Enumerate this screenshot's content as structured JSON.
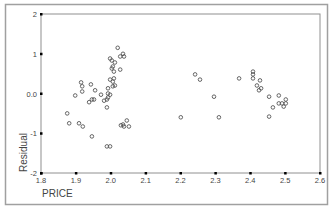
{
  "chart_data": {
    "type": "scatter",
    "title": "",
    "xlabel": "PRICE",
    "ylabel": "Residual",
    "xlim": [
      1.8,
      2.6
    ],
    "ylim": [
      -2,
      2
    ],
    "x_ticks": [
      "1.8",
      "1.9",
      "2.0",
      "2.1",
      "2.2",
      "2.3",
      "2.4",
      "2.5",
      "2.6"
    ],
    "y_ticks": [
      "2",
      "1",
      "0.0",
      "-1",
      "-2"
    ],
    "grid": false,
    "legend": null,
    "marker": "open-circle",
    "series": [
      {
        "name": "Residual vs PRICE",
        "points": [
          [
            2.02,
            1.15
          ],
          [
            2.035,
            1.0
          ],
          [
            2.027,
            0.93
          ],
          [
            2.038,
            0.93
          ],
          [
            1.998,
            0.88
          ],
          [
            2.003,
            0.83
          ],
          [
            2.012,
            0.78
          ],
          [
            2.006,
            0.68
          ],
          [
            2.003,
            0.63
          ],
          [
            2.027,
            0.6
          ],
          [
            2.009,
            0.55
          ],
          [
            1.998,
            0.35
          ],
          [
            2.009,
            0.38
          ],
          [
            2.006,
            0.3
          ],
          [
            1.915,
            0.28
          ],
          [
            1.918,
            0.18
          ],
          [
            1.943,
            0.23
          ],
          [
            1.918,
            0.05
          ],
          [
            1.955,
            0.08
          ],
          [
            1.898,
            -0.05
          ],
          [
            1.972,
            -0.03
          ],
          [
            1.992,
            0.13
          ],
          [
            2.006,
            0.18
          ],
          [
            2.012,
            0.2
          ],
          [
            1.992,
            0.0
          ],
          [
            1.998,
            -0.03
          ],
          [
            1.946,
            -0.15
          ],
          [
            1.952,
            -0.15
          ],
          [
            1.938,
            -0.22
          ],
          [
            1.981,
            -0.18
          ],
          [
            1.989,
            -0.15
          ],
          [
            1.992,
            -0.1
          ],
          [
            1.989,
            -0.35
          ],
          [
            1.875,
            -0.5
          ],
          [
            1.881,
            -0.75
          ],
          [
            1.909,
            -0.75
          ],
          [
            1.92,
            -0.83
          ],
          [
            1.946,
            -1.08
          ],
          [
            1.989,
            -1.33
          ],
          [
            1.998,
            -1.33
          ],
          [
            2.029,
            -0.8
          ],
          [
            2.035,
            -0.78
          ],
          [
            2.038,
            -0.83
          ],
          [
            2.046,
            -0.68
          ],
          [
            2.052,
            -0.83
          ],
          [
            2.242,
            0.48
          ],
          [
            2.256,
            0.35
          ],
          [
            2.296,
            -0.08
          ],
          [
            2.201,
            -0.6
          ],
          [
            2.31,
            -0.6
          ],
          [
            2.368,
            0.38
          ],
          [
            2.408,
            0.55
          ],
          [
            2.408,
            0.48
          ],
          [
            2.408,
            0.38
          ],
          [
            2.428,
            0.33
          ],
          [
            2.419,
            0.2
          ],
          [
            2.431,
            0.13
          ],
          [
            2.425,
            0.08
          ],
          [
            2.454,
            -0.08
          ],
          [
            2.482,
            -0.05
          ],
          [
            2.502,
            -0.15
          ],
          [
            2.491,
            -0.25
          ],
          [
            2.502,
            -0.25
          ],
          [
            2.482,
            -0.25
          ],
          [
            2.465,
            -0.35
          ],
          [
            2.454,
            -0.58
          ],
          [
            2.496,
            -0.33
          ]
        ]
      }
    ]
  },
  "colors": {
    "frame": "#a0a0a0",
    "axis": "#808080",
    "tick_mark": "#000000",
    "marker_stroke": "#555555",
    "text": "#444444",
    "background": "#ffffff"
  }
}
